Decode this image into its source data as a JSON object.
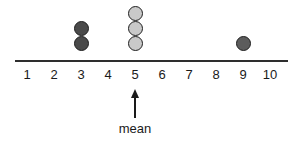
{
  "chart_data": {
    "type": "scatter",
    "title": "",
    "xlabel": "",
    "ylabel": "",
    "xlim": [
      1,
      10
    ],
    "grid": false,
    "legend": null,
    "categories": [
      "1",
      "2",
      "3",
      "4",
      "5",
      "6",
      "7",
      "8",
      "9",
      "10"
    ],
    "values": [
      0,
      0,
      2,
      0,
      3,
      0,
      0,
      0,
      1,
      0
    ],
    "dots": [
      {
        "value": 3,
        "stack": 1,
        "color": "#4a4a4a",
        "name": "dot-value-3-stack-1"
      },
      {
        "value": 3,
        "stack": 2,
        "color": "#4a4a4a",
        "name": "dot-value-3-stack-2"
      },
      {
        "value": 5,
        "stack": 1,
        "color": "#c9c9c9",
        "name": "dot-value-5-stack-1"
      },
      {
        "value": 5,
        "stack": 2,
        "color": "#c9c9c9",
        "name": "dot-value-5-stack-2"
      },
      {
        "value": 5,
        "stack": 3,
        "color": "#c9c9c9",
        "name": "dot-value-5-stack-3"
      },
      {
        "value": 9,
        "stack": 1,
        "color": "#5c5c5c",
        "name": "dot-value-9-stack-1"
      }
    ],
    "annotations": [
      {
        "label": "mean",
        "at_value": 5,
        "arrow": "up"
      }
    ],
    "colors": {
      "axis": "#2e2e2e",
      "text": "#1a1a1a",
      "dot_dark": "#4a4a4a",
      "dot_light": "#c9c9c9",
      "dot_medium": "#5c5c5c",
      "dot_outline": "#1f1f1f",
      "background": "#ffffff"
    },
    "geometry": {
      "axis_x_start": 15,
      "axis_x_end": 288,
      "axis_y": 60,
      "tick_x_start": 27,
      "tick_spacing": 27,
      "dot_base_y": 43,
      "dot_row_spacing": 15
    }
  }
}
